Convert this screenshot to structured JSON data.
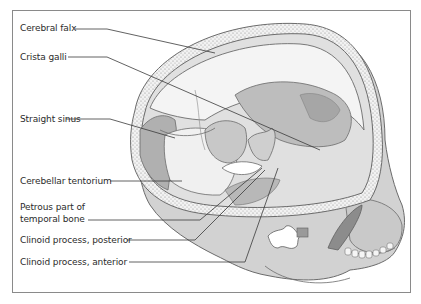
{
  "figure": {
    "labels": [
      {
        "id": "cerebral-falx",
        "text": "Cerebral falx"
      },
      {
        "id": "crista-galli",
        "text": "Crista galli"
      },
      {
        "id": "straight-sinus",
        "text": "Straight sinus"
      },
      {
        "id": "cerebellar-tentorium",
        "text": "Cerebellar tentorium"
      },
      {
        "id": "petrous-part-line1",
        "text": "Petrous part of"
      },
      {
        "id": "petrous-part-line2",
        "text": "temporal bone"
      },
      {
        "id": "clinoid-posterior",
        "text": "Clinoid process, posterior"
      },
      {
        "id": "clinoid-anterior",
        "text": "Clinoid process, anterior"
      }
    ]
  },
  "colors": {
    "frame": "#8a8a8a",
    "text": "#2b2b2b",
    "bone": "#d4d4d4",
    "bone_dark": "#a9a9a9",
    "dura": "#ececec",
    "shadow": "#b5b5b5",
    "leader": "#3a3a3a"
  }
}
